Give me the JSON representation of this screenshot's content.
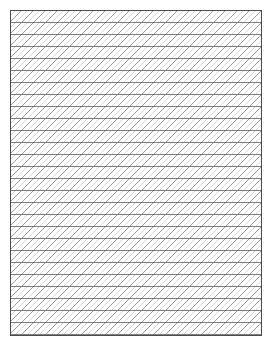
{
  "canvas": {
    "width": 272,
    "height": 345,
    "background_color": "#ffffff"
  },
  "panel": {
    "name": "hatched-rectangle",
    "left": 10,
    "top": 10,
    "width": 252,
    "height": 326,
    "fill_color": "#ffffff",
    "border_color": "#4d4d4d",
    "border_width": 1
  },
  "pattern": {
    "type": "cross-hatch-lattice",
    "description": "Horizontal rules overlaid with 45 degree diagonals rising to the right, forming parallelogram cells",
    "cell_size": 12,
    "horizontal": {
      "name": "horizontal-rule",
      "spacing": 12,
      "angle_deg": 0,
      "color": "#6e6e6e",
      "width": 0.9,
      "count": 27
    },
    "diagonal_primary": {
      "name": "diagonal-rule-primary",
      "spacing": 12,
      "angle_deg": 45,
      "direction": "up-right",
      "color": "#8a8a8a",
      "width": 0.9,
      "count": 49
    },
    "diagonal_secondary": {
      "name": "diagonal-rule-secondary",
      "spacing": 12,
      "offset": 6,
      "angle_deg": 45,
      "direction": "up-right",
      "color": "#cfcfcf",
      "width": 0.7,
      "count": 49
    }
  }
}
